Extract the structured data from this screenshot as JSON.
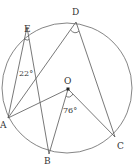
{
  "diagram": {
    "type": "circle-geometry",
    "circle": {
      "center": "O",
      "cx": 67,
      "cy": 88,
      "r": 65
    },
    "points": {
      "A": {
        "label": "A",
        "x": 8,
        "y": 118,
        "lx": 0,
        "ly": 128
      },
      "B": {
        "label": "B",
        "x": 49,
        "y": 154,
        "lx": 44,
        "ly": 164
      },
      "C": {
        "label": "C",
        "x": 115,
        "y": 137,
        "lx": 117,
        "ly": 149
      },
      "D": {
        "label": "D",
        "x": 76,
        "y": 22,
        "lx": 72,
        "ly": 15
      },
      "E": {
        "label": "E",
        "x": 27,
        "y": 27,
        "lx": 24,
        "ly": 23
      },
      "O": {
        "label": "O",
        "x": 68,
        "y": 89,
        "lx": 63,
        "ly": 84
      }
    },
    "segments": [
      [
        "E",
        "A"
      ],
      [
        "E",
        "B"
      ],
      [
        "A",
        "D"
      ],
      [
        "D",
        "C"
      ],
      [
        "A",
        "O"
      ],
      [
        "O",
        "B"
      ],
      [
        "O",
        "C"
      ]
    ],
    "angles": [
      {
        "vertex": "E",
        "text": "22°",
        "x": 19,
        "y": 76
      },
      {
        "vertex": "O",
        "text": "76°",
        "x": 63,
        "y": 113
      },
      {
        "vertex": "D",
        "text": "",
        "x": 0,
        "y": 0
      }
    ]
  }
}
